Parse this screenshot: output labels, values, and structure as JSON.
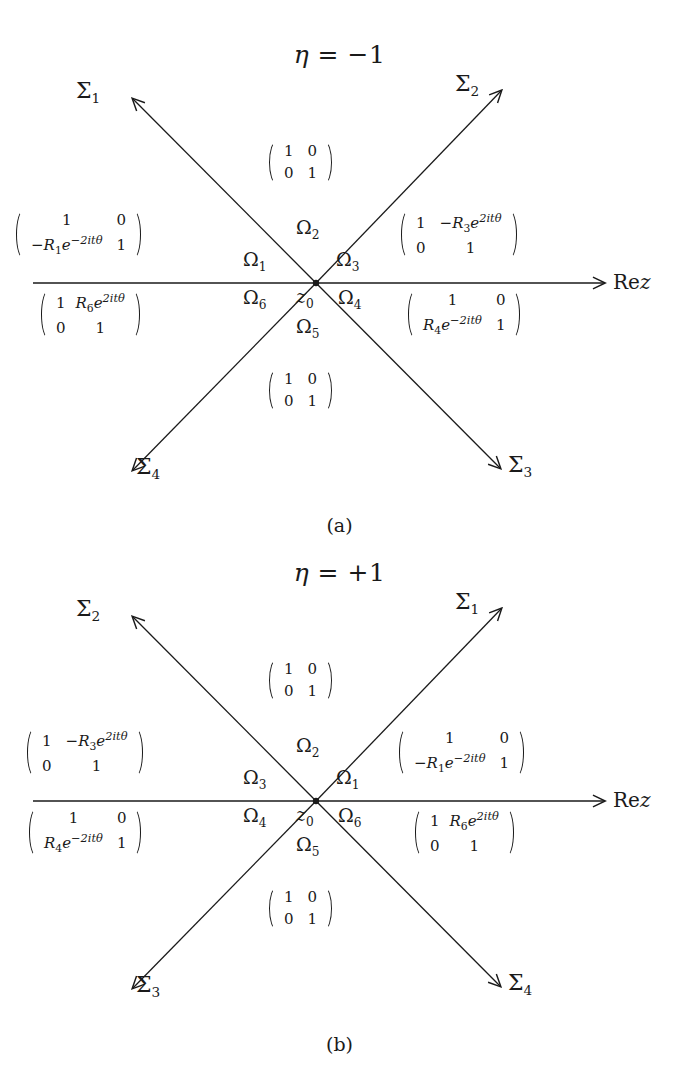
{
  "figure": {
    "kind": "riemann-hilbert-jump-contour",
    "panels": [
      {
        "id": "a",
        "caption": "(a)",
        "title": "η = −1",
        "title_symbol": "η",
        "title_relation": "=",
        "title_value": "−1",
        "axis_label": "Rez",
        "center_point_label": "z0",
        "rays": [
          {
            "name": "Σ1",
            "label": "Σ",
            "sub": "1",
            "direction": "up-left"
          },
          {
            "name": "Σ2",
            "label": "Σ",
            "sub": "2",
            "direction": "up-right"
          },
          {
            "name": "Σ3",
            "label": "Σ",
            "sub": "3",
            "direction": "down-right"
          },
          {
            "name": "Σ4",
            "label": "Σ",
            "sub": "4",
            "direction": "down-left"
          }
        ],
        "regions": [
          {
            "name": "Ω1",
            "label": "Ω",
            "sub": "1"
          },
          {
            "name": "Ω2",
            "label": "Ω",
            "sub": "2"
          },
          {
            "name": "Ω3",
            "label": "Ω",
            "sub": "3"
          },
          {
            "name": "Ω4",
            "label": "Ω",
            "sub": "4"
          },
          {
            "name": "Ω5",
            "label": "Ω",
            "sub": "5"
          },
          {
            "name": "Ω6",
            "label": "Ω",
            "sub": "6"
          }
        ],
        "matrices": [
          {
            "position": "top",
            "rows": [
              [
                "1",
                "0"
              ],
              [
                "0",
                "1"
              ]
            ]
          },
          {
            "position": "upper-left",
            "rows": [
              [
                {
                  "text": "1"
                },
                {
                  "text": "0"
                }
              ],
              [
                {
                  "text": "−R",
                  "sub": "1",
                  "base": "e",
                  "exp": "−2itθ"
                },
                {
                  "text": "1"
                }
              ]
            ]
          },
          {
            "position": "upper-right",
            "rows": [
              [
                {
                  "text": "1"
                },
                {
                  "text": "−R",
                  "sub": "3",
                  "base": "e",
                  "exp": "2itθ"
                }
              ],
              [
                {
                  "text": "0"
                },
                {
                  "text": "1"
                }
              ]
            ]
          },
          {
            "position": "lower-left",
            "rows": [
              [
                {
                  "text": "1"
                },
                {
                  "text": "R",
                  "sub": "6",
                  "base": "e",
                  "exp": "2itθ"
                }
              ],
              [
                {
                  "text": "0"
                },
                {
                  "text": "1"
                }
              ]
            ]
          },
          {
            "position": "lower-right",
            "rows": [
              [
                {
                  "text": "1"
                },
                {
                  "text": "0"
                }
              ],
              [
                {
                  "text": "R",
                  "sub": "4",
                  "base": "e",
                  "exp": "−2itθ"
                },
                {
                  "text": "1"
                }
              ]
            ]
          },
          {
            "position": "bottom",
            "rows": [
              [
                "1",
                "0"
              ],
              [
                "0",
                "1"
              ]
            ]
          }
        ]
      },
      {
        "id": "b",
        "caption": "(b)",
        "title": "η = +1",
        "title_symbol": "η",
        "title_relation": "=",
        "title_value": "+1",
        "axis_label": "Rez",
        "center_point_label": "z0",
        "rays": [
          {
            "name": "Σ2",
            "label": "Σ",
            "sub": "2",
            "direction": "up-left"
          },
          {
            "name": "Σ1",
            "label": "Σ",
            "sub": "1",
            "direction": "up-right"
          },
          {
            "name": "Σ4",
            "label": "Σ",
            "sub": "4",
            "direction": "down-right"
          },
          {
            "name": "Σ3",
            "label": "Σ",
            "sub": "3",
            "direction": "down-left"
          }
        ],
        "regions": [
          {
            "name": "Ω3",
            "label": "Ω",
            "sub": "3"
          },
          {
            "name": "Ω2",
            "label": "Ω",
            "sub": "2"
          },
          {
            "name": "Ω1",
            "label": "Ω",
            "sub": "1"
          },
          {
            "name": "Ω4",
            "label": "Ω",
            "sub": "4"
          },
          {
            "name": "Ω5",
            "label": "Ω",
            "sub": "5"
          },
          {
            "name": "Ω6",
            "label": "Ω",
            "sub": "6"
          }
        ],
        "matrices": [
          {
            "position": "top",
            "rows": [
              [
                "1",
                "0"
              ],
              [
                "0",
                "1"
              ]
            ]
          },
          {
            "position": "upper-left",
            "rows": [
              [
                {
                  "text": "1"
                },
                {
                  "text": "−R",
                  "sub": "3",
                  "base": "e",
                  "exp": "2itθ"
                }
              ],
              [
                {
                  "text": "0"
                },
                {
                  "text": "1"
                }
              ]
            ]
          },
          {
            "position": "upper-right",
            "rows": [
              [
                {
                  "text": "1"
                },
                {
                  "text": "0"
                }
              ],
              [
                {
                  "text": "−R",
                  "sub": "1",
                  "base": "e",
                  "exp": "−2itθ"
                },
                {
                  "text": "1"
                }
              ]
            ]
          },
          {
            "position": "lower-left",
            "rows": [
              [
                {
                  "text": "1"
                },
                {
                  "text": "0"
                }
              ],
              [
                {
                  "text": "R",
                  "sub": "4",
                  "base": "e",
                  "exp": "−2itθ"
                },
                {
                  "text": "1"
                }
              ]
            ]
          },
          {
            "position": "lower-right",
            "rows": [
              [
                {
                  "text": "1"
                },
                {
                  "text": "R",
                  "sub": "6",
                  "base": "e",
                  "exp": "2itθ"
                }
              ],
              [
                {
                  "text": "0"
                },
                {
                  "text": "1"
                }
              ]
            ]
          },
          {
            "position": "bottom",
            "rows": [
              [
                "1",
                "0"
              ],
              [
                "0",
                "1"
              ]
            ]
          }
        ]
      }
    ],
    "colors": {
      "ink": "#1a1a1a",
      "background": "#ffffff"
    }
  },
  "panel_a": {
    "title_symbol": "η",
    "title_eq": "= −1",
    "caption": "(a)",
    "axis_label_re": "Re",
    "axis_label_z": "z",
    "z0_base": "z",
    "z0_sub": "0",
    "sigma_ul": "Σ",
    "sigma_ul_sub": "1",
    "sigma_ur": "Σ",
    "sigma_ur_sub": "2",
    "sigma_dr": "Σ",
    "sigma_dr_sub": "3",
    "sigma_dl": "Σ",
    "sigma_dl_sub": "4",
    "omega_top": "Ω",
    "omega_top_sub": "2",
    "omega_ul": "Ω",
    "omega_ul_sub": "1",
    "omega_ur": "Ω",
    "omega_ur_sub": "3",
    "omega_dr": "Ω",
    "omega_dr_sub": "4",
    "omega_dl": "Ω",
    "omega_dl_sub": "6",
    "omega_bottom": "Ω",
    "omega_bottom_sub": "5",
    "m_top": {
      "a": "1",
      "b": "0",
      "c": "0",
      "d": "1"
    },
    "m_bottom": {
      "a": "1",
      "b": "0",
      "c": "0",
      "d": "1"
    },
    "m_ul": {
      "a": "1",
      "b": "0",
      "c_sign": "−",
      "c_R": "R",
      "c_sub": "1",
      "c_e": "e",
      "c_exp": "−2itθ",
      "d": "1"
    },
    "m_ur": {
      "a": "1",
      "b_sign": "−",
      "b_R": "R",
      "b_sub": "3",
      "b_e": "e",
      "b_exp": "2itθ",
      "c": "0",
      "d": "1"
    },
    "m_dl": {
      "a": "1",
      "b_sign": "",
      "b_R": "R",
      "b_sub": "6",
      "b_e": "e",
      "b_exp": "2itθ",
      "c": "0",
      "d": "1"
    },
    "m_dr": {
      "a": "1",
      "b": "0",
      "c_sign": "",
      "c_R": "R",
      "c_sub": "4",
      "c_e": "e",
      "c_exp": "−2itθ",
      "d": "1"
    }
  },
  "panel_b": {
    "title_symbol": "η",
    "title_eq": "= +1",
    "caption": "(b)",
    "axis_label_re": "Re",
    "axis_label_z": "z",
    "z0_base": "z",
    "z0_sub": "0",
    "sigma_ul": "Σ",
    "sigma_ul_sub": "2",
    "sigma_ur": "Σ",
    "sigma_ur_sub": "1",
    "sigma_dr": "Σ",
    "sigma_dr_sub": "4",
    "sigma_dl": "Σ",
    "sigma_dl_sub": "3",
    "omega_top": "Ω",
    "omega_top_sub": "2",
    "omega_ul": "Ω",
    "omega_ul_sub": "3",
    "omega_ur": "Ω",
    "omega_ur_sub": "1",
    "omega_dr": "Ω",
    "omega_dr_sub": "6",
    "omega_dl": "Ω",
    "omega_dl_sub": "4",
    "omega_bottom": "Ω",
    "omega_bottom_sub": "5",
    "m_top": {
      "a": "1",
      "b": "0",
      "c": "0",
      "d": "1"
    },
    "m_bottom": {
      "a": "1",
      "b": "0",
      "c": "0",
      "d": "1"
    },
    "m_ul": {
      "a": "1",
      "b_sign": "−",
      "b_R": "R",
      "b_sub": "3",
      "b_e": "e",
      "b_exp": "2itθ",
      "c": "0",
      "d": "1"
    },
    "m_ur": {
      "a": "1",
      "b": "0",
      "c_sign": "−",
      "c_R": "R",
      "c_sub": "1",
      "c_e": "e",
      "c_exp": "−2itθ",
      "d": "1"
    },
    "m_dl": {
      "a": "1",
      "b": "0",
      "c_sign": "",
      "c_R": "R",
      "c_sub": "4",
      "c_e": "e",
      "c_exp": "−2itθ",
      "d": "1"
    },
    "m_dr": {
      "a": "1",
      "b_sign": "",
      "b_R": "R",
      "b_sub": "6",
      "b_e": "e",
      "b_exp": "2itθ",
      "c": "0",
      "d": "1"
    }
  }
}
